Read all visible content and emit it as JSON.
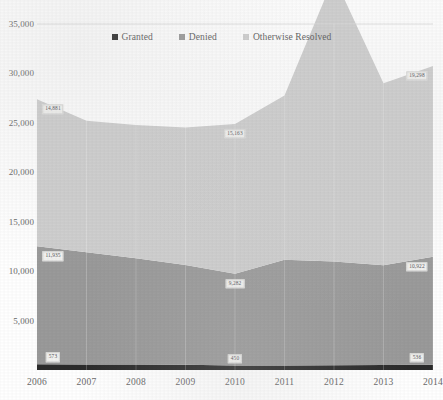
{
  "chart_data": {
    "type": "area",
    "stacked": true,
    "title": "",
    "subtitle": "",
    "xlabel": "",
    "ylabel": "",
    "categories": [
      "2006",
      "2007",
      "2008",
      "2009",
      "2010",
      "2011",
      "2012",
      "2013",
      "2014"
    ],
    "ylim": [
      0,
      35000
    ],
    "yticks": [
      "5,000",
      "10,000",
      "15,000",
      "20,000",
      "25,000",
      "30,000",
      "35,000"
    ],
    "ytick_values": [
      5000,
      10000,
      15000,
      20000,
      25000,
      30000,
      35000
    ],
    "grid": "horizontal-top-only",
    "legend_position": "top-center",
    "series": [
      {
        "name": "Granted",
        "color": "#2b2b2b",
        "values": [
          573,
          560,
          545,
          520,
          450,
          460,
          470,
          500,
          536
        ]
      },
      {
        "name": "Denied",
        "color": "#9a9a9a",
        "values": [
          11935,
          11350,
          10750,
          10100,
          9282,
          10700,
          10500,
          10100,
          10922
        ]
      },
      {
        "name": "Otherwise Resolved",
        "color": "#cfcfcf",
        "values": [
          14881,
          13300,
          13500,
          13900,
          15163,
          16600,
          28796,
          18400,
          19298
        ]
      }
    ],
    "data_labels": [
      {
        "series": "Otherwise Resolved",
        "category": "2006",
        "text": "14,881"
      },
      {
        "series": "Otherwise Resolved",
        "category": "2010",
        "text": "15,163"
      },
      {
        "series": "Otherwise Resolved",
        "category": "2012",
        "text": "28,796"
      },
      {
        "series": "Otherwise Resolved",
        "category": "2014",
        "text": "19,298"
      },
      {
        "series": "Denied",
        "category": "2006",
        "text": "11,935"
      },
      {
        "series": "Denied",
        "category": "2010",
        "text": "9,282"
      },
      {
        "series": "Denied",
        "category": "2014",
        "text": "10,922"
      },
      {
        "series": "Granted",
        "category": "2006",
        "text": "573"
      },
      {
        "series": "Granted",
        "category": "2010",
        "text": "450"
      },
      {
        "series": "Granted",
        "category": "2014",
        "text": "536"
      }
    ]
  }
}
